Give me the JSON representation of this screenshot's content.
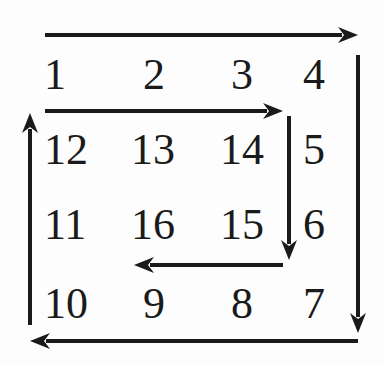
{
  "diagram": {
    "title": "",
    "rows": [
      [
        "1",
        "2",
        "3",
        "4"
      ],
      [
        "12",
        "13",
        "14",
        "5"
      ],
      [
        "11",
        "16",
        "15",
        "6"
      ],
      [
        "10",
        "9",
        "8",
        "7"
      ]
    ],
    "cells": [
      {
        "label": "1",
        "x": 44,
        "y": 53
      },
      {
        "label": "2",
        "x": 143,
        "y": 53
      },
      {
        "label": "3",
        "x": 231,
        "y": 53
      },
      {
        "label": "4",
        "x": 303,
        "y": 53
      },
      {
        "label": "12",
        "x": 44,
        "y": 128
      },
      {
        "label": "13",
        "x": 131,
        "y": 128
      },
      {
        "label": "14",
        "x": 220,
        "y": 128
      },
      {
        "label": "5",
        "x": 303,
        "y": 128
      },
      {
        "label": "11",
        "x": 44,
        "y": 203
      },
      {
        "label": "16",
        "x": 131,
        "y": 203
      },
      {
        "label": "15",
        "x": 220,
        "y": 203
      },
      {
        "label": "6",
        "x": 303,
        "y": 203
      },
      {
        "label": "10",
        "x": 44,
        "y": 282
      },
      {
        "label": "9",
        "x": 143,
        "y": 282
      },
      {
        "label": "8",
        "x": 231,
        "y": 282
      },
      {
        "label": "7",
        "x": 303,
        "y": 282
      }
    ],
    "arrows": [
      {
        "name": "outer-right-arrow",
        "direction": "right",
        "from": [
          45,
          35
        ],
        "to": [
          358,
          35
        ]
      },
      {
        "name": "outer-down-arrow",
        "direction": "down",
        "from": [
          358,
          55
        ],
        "to": [
          358,
          333
        ]
      },
      {
        "name": "outer-left-arrow",
        "direction": "left",
        "from": [
          358,
          341
        ],
        "to": [
          30,
          341
        ]
      },
      {
        "name": "outer-up-arrow",
        "direction": "up",
        "from": [
          30,
          325
        ],
        "to": [
          30,
          113
        ]
      },
      {
        "name": "inner-right-arrow",
        "direction": "right",
        "from": [
          45,
          111
        ],
        "to": [
          283,
          111
        ]
      },
      {
        "name": "inner-down-arrow",
        "direction": "down",
        "from": [
          289,
          116
        ],
        "to": [
          289,
          260
        ]
      },
      {
        "name": "inner-left-arrow",
        "direction": "left",
        "from": [
          283,
          265
        ],
        "to": [
          134,
          265
        ]
      }
    ],
    "colors": {
      "ink": "#1a1a1a",
      "background": "#fdfdfd"
    }
  }
}
